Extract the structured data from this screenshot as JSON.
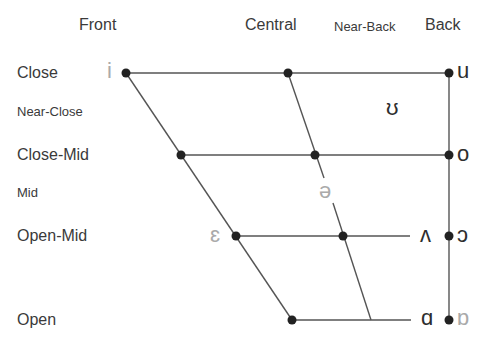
{
  "columns": {
    "front": "Front",
    "central": "Central",
    "near_back": "Near-Back",
    "back": "Back"
  },
  "rows": {
    "close": "Close",
    "near_close": "Near-Close",
    "close_mid": "Close-Mid",
    "mid": "Mid",
    "open_mid": "Open-Mid",
    "open": "Open"
  },
  "vowels": {
    "i": "i",
    "u": "u",
    "upsilon": "ʊ",
    "o": "o",
    "schwa": "ə",
    "epsilon": "ɛ",
    "wedge": "ʌ",
    "open_o": "ɔ",
    "script_a": "ɑ",
    "turned_script_a": "ɒ"
  },
  "colors": {
    "line": "#555555",
    "dot": "#222222",
    "rounded_vowel": "#aaaaaa",
    "unrounded_vowel": "#2e2e2e"
  }
}
